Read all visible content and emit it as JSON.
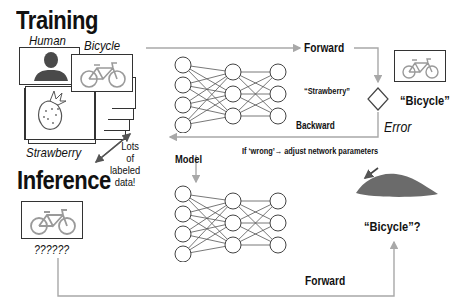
{
  "training": {
    "title": "Training",
    "samples": {
      "human_label": "Human",
      "bicycle_label": "Bicycle",
      "strawberry_label": "Strawberry",
      "note_line1": "Lots of",
      "note_line2": "labeled data!"
    },
    "forward_label": "Forward",
    "backward_label": "Backward",
    "prediction_label": "“Strawberry”",
    "target_label": "“Bicycle”",
    "error_label": "Error",
    "adjust_note": "If ‘wrong’→ adjust network parameters"
  },
  "model_label": "Model",
  "inference": {
    "title": "Inference",
    "unknown_label": "??????",
    "forward_label": "Forward",
    "result_label": "“Bicycle”?"
  },
  "colors": {
    "arrow": "#a8a8a8",
    "bike_icon": "#9a9a9a",
    "silhouette": "#4a4a4a",
    "hill": "#6b6b6b",
    "node_stroke": "#444444"
  }
}
